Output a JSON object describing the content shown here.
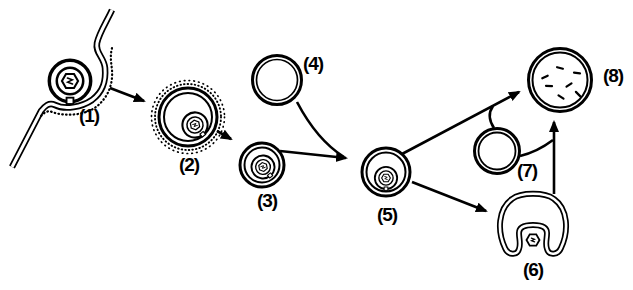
{
  "figure": {
    "kind": "black-and-white line diagram, eight numbered stages of vesicle pathway",
    "background_color": "#ffffff",
    "ink_color": "#000000"
  },
  "stages": [
    {
      "label": "(1)",
      "name": "particle-in-membrane-invagination"
    },
    {
      "label": "(2)",
      "name": "coated-vesicle-with-particle"
    },
    {
      "label": "(3)",
      "name": "smooth-vesicle-with-particle"
    },
    {
      "label": "(4)",
      "name": "empty-vesicle"
    },
    {
      "label": "(5)",
      "name": "large-vesicle-with-particle"
    },
    {
      "label": "(6)",
      "name": "cup-shaped-vesicle-with-particle"
    },
    {
      "label": "(7)",
      "name": "empty-vesicle"
    },
    {
      "label": "(8)",
      "name": "vesicle-with-dispersed-fragments"
    }
  ]
}
